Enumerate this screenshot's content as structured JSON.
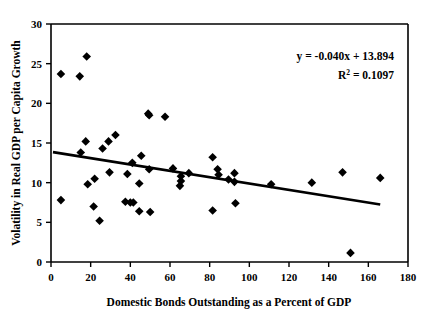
{
  "chart_data": {
    "type": "scatter",
    "title": "",
    "xlabel": "Domestic Bonds Outstanding as a Percent of GDP",
    "ylabel": "Volatility in Real GDP per Capita Growth",
    "xlim": [
      0,
      180
    ],
    "ylim": [
      0,
      30
    ],
    "xticks": [
      0,
      20,
      40,
      60,
      80,
      100,
      120,
      140,
      160,
      180
    ],
    "yticks": [
      0,
      5,
      10,
      15,
      20,
      25,
      30
    ],
    "grid": false,
    "legend": null,
    "marker_shape": "diamond",
    "marker_color": "#000000",
    "annotations": [
      {
        "text": "y = -0.040x + 13.894",
        "x": 120,
        "y": 25.2
      },
      {
        "text": "R2 = 0.1097",
        "display": "R² = 0.1097",
        "x": 125,
        "y": 23.1
      }
    ],
    "trendline": {
      "type": "linear",
      "slope": -0.04,
      "intercept": 13.894,
      "equation": "y = -0.040x + 13.894",
      "r_squared": 0.1097,
      "x_start": 1.0,
      "x_end": 166.0
    },
    "points": [
      {
        "x": 5.0,
        "y": 23.7
      },
      {
        "x": 5.0,
        "y": 7.8
      },
      {
        "x": 14.5,
        "y": 23.4
      },
      {
        "x": 15.0,
        "y": 13.8
      },
      {
        "x": 17.5,
        "y": 15.2
      },
      {
        "x": 18.0,
        "y": 25.9
      },
      {
        "x": 18.5,
        "y": 9.8
      },
      {
        "x": 21.5,
        "y": 7.0
      },
      {
        "x": 22.0,
        "y": 10.5
      },
      {
        "x": 24.5,
        "y": 5.2
      },
      {
        "x": 26.0,
        "y": 14.3
      },
      {
        "x": 29.0,
        "y": 15.2
      },
      {
        "x": 29.5,
        "y": 11.3
      },
      {
        "x": 32.5,
        "y": 16.0
      },
      {
        "x": 37.5,
        "y": 7.6
      },
      {
        "x": 38.5,
        "y": 11.1
      },
      {
        "x": 40.0,
        "y": 7.5
      },
      {
        "x": 41.0,
        "y": 12.5
      },
      {
        "x": 41.5,
        "y": 7.5
      },
      {
        "x": 44.5,
        "y": 6.4
      },
      {
        "x": 44.5,
        "y": 9.9
      },
      {
        "x": 45.5,
        "y": 13.4
      },
      {
        "x": 49.0,
        "y": 18.7
      },
      {
        "x": 49.5,
        "y": 18.5
      },
      {
        "x": 49.5,
        "y": 11.7
      },
      {
        "x": 50.0,
        "y": 6.3
      },
      {
        "x": 57.5,
        "y": 18.3
      },
      {
        "x": 61.5,
        "y": 11.8
      },
      {
        "x": 65.0,
        "y": 9.6
      },
      {
        "x": 65.5,
        "y": 10.2
      },
      {
        "x": 65.5,
        "y": 10.8
      },
      {
        "x": 69.5,
        "y": 11.2
      },
      {
        "x": 81.5,
        "y": 13.2
      },
      {
        "x": 81.5,
        "y": 6.5
      },
      {
        "x": 84.0,
        "y": 11.7
      },
      {
        "x": 84.5,
        "y": 11.0
      },
      {
        "x": 89.5,
        "y": 10.4
      },
      {
        "x": 92.5,
        "y": 11.2
      },
      {
        "x": 92.5,
        "y": 10.1
      },
      {
        "x": 93.0,
        "y": 7.4
      },
      {
        "x": 111.0,
        "y": 9.8
      },
      {
        "x": 131.5,
        "y": 10.0
      },
      {
        "x": 147.0,
        "y": 11.3
      },
      {
        "x": 151.0,
        "y": 1.15
      },
      {
        "x": 166.0,
        "y": 10.6
      }
    ]
  },
  "axes": {
    "x_tick_labels": [
      "0",
      "20",
      "40",
      "60",
      "80",
      "100",
      "120",
      "140",
      "160",
      "180"
    ],
    "y_tick_labels": [
      "0",
      "5",
      "10",
      "15",
      "20",
      "25",
      "30"
    ],
    "x_axis_title": "Domestic Bonds Outstanding as a Percent of GDP",
    "y_axis_title": "Volatility in Real GDP per Capita Growth"
  },
  "annotation_block": {
    "equation": "y = -0.040x + 13.894",
    "r_label": "R",
    "r_exponent": "2",
    "r_value": " = 0.1097"
  },
  "colors": {
    "marker": "#000000",
    "line": "#000000",
    "axis": "#000000",
    "background": "#ffffff"
  }
}
